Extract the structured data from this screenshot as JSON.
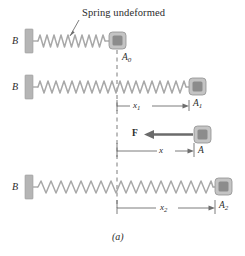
{
  "figure": {
    "caption": "(a)",
    "callout_label": "Spring undeformed",
    "colors": {
      "spring": "#a8a8a8",
      "wall": "#b0b0b0",
      "block_outer": "#c0c0c0",
      "block_inner": "#8c8c8c",
      "line": "#6e6e6e",
      "dash": "#6e6e6e",
      "arrow": "#6b6b6b",
      "text": "#2b2b2b"
    }
  },
  "rows": [
    {
      "name": "undeformed",
      "wall_label": "B",
      "block_label": "A",
      "block_sub": "0",
      "coils": 21,
      "dimension": null,
      "dimension_sub": null
    },
    {
      "name": "stretched-x1",
      "wall_label": "B",
      "block_label": "A",
      "block_sub": "1",
      "coils": 19,
      "dimension": "x",
      "dimension_sub": "1"
    },
    {
      "name": "stretched-x2",
      "wall_label": "B",
      "block_label": "A",
      "block_sub": "2",
      "coils": 18,
      "dimension": "x",
      "dimension_sub": "2"
    }
  ],
  "force_row": {
    "force_label": "F",
    "block_label": "A",
    "block_sub": "",
    "dimension": "x",
    "dimension_sub": "",
    "force_direction": "left"
  }
}
